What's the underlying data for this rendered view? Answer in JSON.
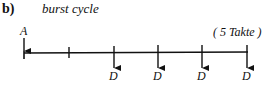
{
  "figure": {
    "part_label": "b)",
    "title": "burst cycle",
    "note": "( 5 Takte )",
    "timeline": {
      "start_marker": {
        "label": "A",
        "x": 24,
        "direction": "down"
      },
      "ticks": [
        {
          "x": 69,
          "type": "tick"
        },
        {
          "x": 114,
          "type": "arrow-down",
          "label": "D"
        },
        {
          "x": 158,
          "type": "arrow-down",
          "label": "D"
        },
        {
          "x": 202,
          "type": "arrow-down",
          "label": "D"
        },
        {
          "x": 247,
          "type": "arrow-down",
          "label": "D"
        }
      ]
    },
    "labels": {
      "a": "A",
      "d1": "D",
      "d2": "D",
      "d3": "D",
      "d4": "D"
    },
    "colors": {
      "ink": "#111111",
      "background": "#ffffff"
    }
  }
}
